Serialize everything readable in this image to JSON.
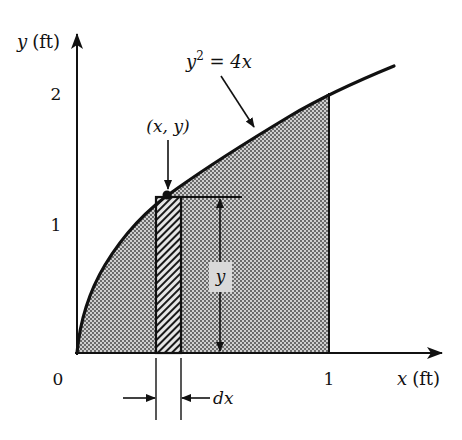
{
  "figure": {
    "type": "area-under-curve",
    "curve": {
      "equation_lhs_base": "y",
      "equation_lhs_exp": "2",
      "equation_rhs": " = 4x",
      "function": "y = 2*sqrt(x)",
      "x_end_drawn": 1.26
    },
    "shaded_region": {
      "x_from": 0,
      "x_to": 1,
      "fill": "stippled gray"
    },
    "strip": {
      "x_position": 0.31,
      "width_label": "dx",
      "fill": "diagonal hatch"
    },
    "point_label": "(x, y)",
    "height_label": "y",
    "axes": {
      "x_label_var": "x",
      "x_label_unit": "(ft)",
      "y_label_var": "y",
      "y_label_unit": "(ft)",
      "origin_label": "0",
      "x_ticks": [
        "1"
      ],
      "y_ticks": [
        "1",
        "2"
      ]
    },
    "colors": {
      "ink": "#111111",
      "shade": "#c8c8c8",
      "dots": "#3a3a3a",
      "label_box": "#d9d9d9"
    }
  }
}
